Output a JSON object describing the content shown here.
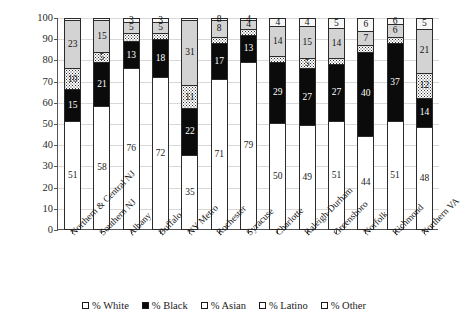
{
  "chart_data": {
    "type": "bar",
    "subtype": "stacked-bar-100",
    "title": "",
    "xlabel": "",
    "ylabel": "",
    "ylim": [
      0,
      100
    ],
    "y_ticks": [
      0,
      10,
      20,
      30,
      40,
      50,
      60,
      70,
      80,
      90,
      100
    ],
    "grid": true,
    "legend_position": "bottom",
    "categories": [
      "Northern & Central NJ",
      "Southern NJ",
      "Albany",
      "Buffalo",
      "NY Metro",
      "Rochester",
      "Syracuse",
      "Charlotte",
      "Raleigh-Durham",
      "Greensboro",
      "Norfolk",
      "Richmond",
      "Northern VA"
    ],
    "series": [
      {
        "name": "% White",
        "fill": "white",
        "values": [
          51,
          58,
          76,
          72,
          35,
          71,
          79,
          50,
          49,
          51,
          44,
          51,
          48
        ]
      },
      {
        "name": "% Black",
        "fill": "black",
        "values": [
          15,
          21,
          13,
          18,
          22,
          17,
          13,
          29,
          27,
          27,
          40,
          37,
          14
        ]
      },
      {
        "name": "% Asian",
        "fill": "asian",
        "values": [
          10,
          5,
          4,
          3,
          11,
          3,
          3,
          3,
          5,
          3,
          3,
          3,
          12
        ]
      },
      {
        "name": "% Latino",
        "fill": "latino",
        "values": [
          23,
          15,
          5,
          5,
          31,
          8,
          4,
          14,
          15,
          14,
          7,
          6,
          21
        ]
      },
      {
        "name": "% Other",
        "fill": "other",
        "values": [
          1,
          1,
          2,
          2,
          1,
          1,
          1,
          4,
          4,
          5,
          6,
          3,
          5
        ]
      }
    ],
    "segment_labels": {
      "% White": [
        "51",
        "58",
        "76",
        "72",
        "35",
        "71",
        "79",
        "50",
        "49",
        "51",
        "44",
        "51",
        "48"
      ],
      "% Black": [
        "15",
        "21",
        "13",
        "18",
        "22",
        "17",
        "13",
        "29",
        "27",
        "27",
        "40",
        "37",
        "14"
      ],
      "% Asian": [
        "10",
        "5",
        "",
        "",
        "11",
        "",
        "",
        "",
        "5",
        "",
        "",
        "",
        "12"
      ],
      "% Latino": [
        "23",
        "15",
        "5",
        "5",
        "31",
        "8",
        "4",
        "14",
        "15",
        "14",
        "7",
        "6",
        "21"
      ],
      "% Other": [
        "",
        "",
        "3",
        "3",
        "",
        "8",
        "4",
        "4",
        "4",
        "5",
        "6",
        "6",
        "5"
      ]
    }
  },
  "legend": {
    "items": [
      {
        "label": "% White",
        "fill": "white"
      },
      {
        "label": "% Black",
        "fill": "black"
      },
      {
        "label": "% Asian",
        "fill": "asian"
      },
      {
        "label": "% Latino",
        "fill": "latino"
      },
      {
        "label": "% Other",
        "fill": "other"
      }
    ]
  },
  "colors": {
    "white": "#ffffff",
    "black": "#0b0b0b",
    "asian": "#ffffff",
    "latino": "#d3d3d3",
    "other": "#f7f7f7",
    "axis": "#555555",
    "grid": "#d8d8d8",
    "text": "#1a1a1a"
  }
}
